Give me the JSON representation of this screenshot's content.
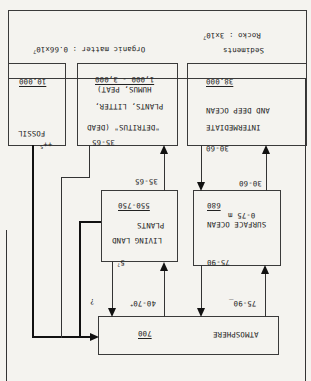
{
  "orientation": "rotated-180",
  "reservoirs": {
    "sediments": {
      "label": "Sediments",
      "rocks": "Rocko : 3x10",
      "rocks_exp": "7",
      "organic": "Organic matter : 0.66x10",
      "organic_exp": "7"
    },
    "fossil": {
      "label": "FOSSIL",
      "value": "10,000"
    },
    "detritus": {
      "line1": "\"DETRITUS\" (DEAD",
      "line2": "PLANTS, LITTER,",
      "line3": "HUMUS, PEAT)",
      "value": "1,000 - 3,000"
    },
    "intermediate_ocean": {
      "line1": "INTERMEDIATE",
      "line2": "AND DEEP OCEAN",
      "value": "38,000"
    },
    "living_land_plants": {
      "line1": "LIVING LAND",
      "line2": "PLANTS",
      "value": "550-750"
    },
    "surface_ocean": {
      "line1": "SURFACE OCEAN",
      "line2": "0-75 m",
      "value": "680"
    },
    "atmosphere": {
      "label": "ATMOSPHERE",
      "value": "700"
    }
  },
  "fluxes": {
    "fossil_to_atm": "5",
    "fossil_to_atm_mark": "++",
    "detritus_out": "35-65",
    "plants_to_detritus": "35-65",
    "deep_to_surface": "30-60",
    "surface_to_deep": "30-60",
    "plants_to_atm": "5",
    "plants_to_atm_mark": "?",
    "atm_to_plants": "40-70",
    "atm_to_plants_mark": "+",
    "unknown_flux": "?",
    "surface_to_atm": "75-90",
    "atm_to_surface": "75-90",
    "atm_to_surface_mark": "_"
  }
}
